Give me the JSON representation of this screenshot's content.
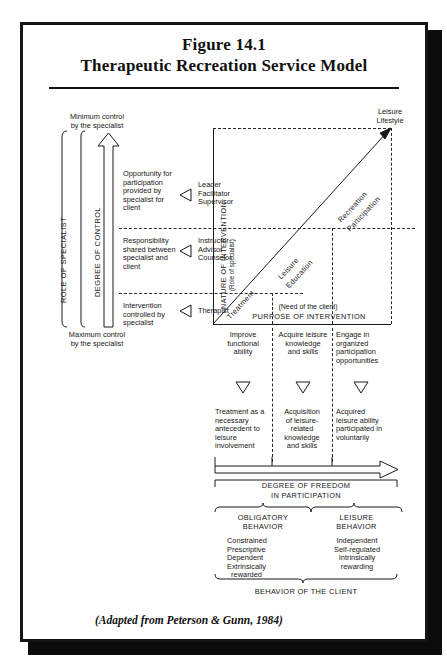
{
  "figure": {
    "number": "Figure 14.1",
    "title": "Therapeutic Recreation Service Model",
    "credit": "(Adapted from Peterson & Gunn, 1984)"
  },
  "left_panel": {
    "top_note_line1": "Minimum control",
    "top_note_line2": "by the specialist",
    "bottom_note_line1": "Maximum control",
    "bottom_note_line2": "by the specialist",
    "axis_outer_label": "ROLE OF SPECIALIST",
    "axis_inner_label": "DEGREE OF CONTROL",
    "rows": [
      {
        "description": "Opportunity for participation provided by specialist for client",
        "roles": "Leader\nFacilitator\nSupervisor",
        "role_lines": [
          "Leader",
          "Facilitator",
          "Supervisor"
        ]
      },
      {
        "description": "Responsibility shared between specialist and client",
        "roles": "Instructor\nAdvisor\nCounselor",
        "role_lines": [
          "Instructor",
          "Advisor",
          "Counselor"
        ]
      },
      {
        "description": "Intervention controlled by specialist",
        "roles": "Therapist",
        "role_lines": [
          "Therapist"
        ]
      }
    ]
  },
  "chart": {
    "y_axis_label": "NATURE OF INTERVENTION",
    "y_axis_sublabel": "(Role of specialist)",
    "x_axis_label": "PURPOSE OF INTERVENTION",
    "x_axis_sublabel": "(Need of the client)",
    "endpoint_label_line1": "Leisure",
    "endpoint_label_line2": "Lifestyle",
    "diagonal_segments": [
      {
        "name": "Treatment",
        "line1": "Treatment",
        "line2": ""
      },
      {
        "name": "Leisure Education",
        "line1": "Leisure",
        "line2": "Education"
      },
      {
        "name": "Recreation Participation",
        "line1": "Recreation",
        "line2": "Participation"
      }
    ]
  },
  "columns": [
    {
      "purpose": "Improve functional ability",
      "purpose_lines": [
        "Improve",
        "functional",
        "ability"
      ],
      "outcome": "Treatment as a necessary antecedent to leisure involvement",
      "outcome_lines": [
        "Treatment as a",
        "necessary",
        "antecedent to",
        "leisure",
        "involvement"
      ]
    },
    {
      "purpose": "Acquire leisure knowledge and skills",
      "purpose_lines": [
        "Acquire leisure",
        "knowledge",
        "and skills"
      ],
      "outcome": "Acquisition of leisure-related knowledge and skills",
      "outcome_lines": [
        "Acquisition",
        "of leisure-",
        "related",
        "knowledge",
        "and skills"
      ]
    },
    {
      "purpose": "Engage in organized participation opportunities",
      "purpose_lines": [
        "Engage in",
        "organized",
        "participation",
        "opportunities"
      ],
      "outcome": "Acquired leisure ability participated in voluntarily",
      "outcome_lines": [
        "Acquired",
        "leisure ability",
        "participated in",
        "voluntarily"
      ]
    }
  ],
  "freedom": {
    "label_line1": "DEGREE OF FREEDOM",
    "label_line2": "IN PARTICIPATION"
  },
  "behavior": {
    "footer_label": "BEHAVIOR OF THE CLIENT",
    "groups": [
      {
        "title_line1": "OBLIGATORY",
        "title_line2": "BEHAVIOR",
        "traits": [
          "Constrained",
          "Prescriptive",
          "Dependent",
          "Extrinsically",
          "rewarded"
        ]
      },
      {
        "title_line1": "LEISURE",
        "title_line2": "BEHAVIOR",
        "traits": [
          "Independent",
          "Self-regulated",
          "Intrinsically",
          "rewarding"
        ]
      }
    ]
  },
  "colors": {
    "ink": "#161616",
    "frame": "#151515",
    "paper": "#ffffff"
  }
}
